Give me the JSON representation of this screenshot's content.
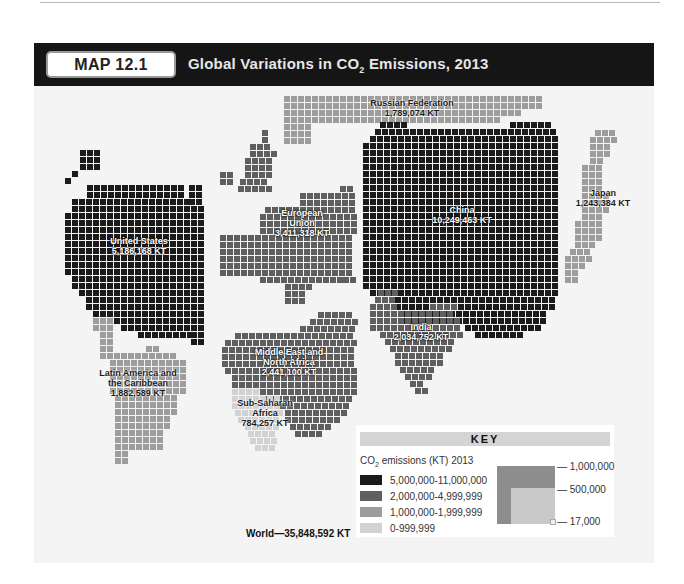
{
  "header": {
    "badge": "MAP 12.1",
    "title_pre": "Global Variations in CO",
    "title_sub": "2",
    "title_post": " Emissions, 2013"
  },
  "colors": {
    "tier1": "#1b1b1b",
    "tier2": "#5f5f5f",
    "tier3": "#9d9d9d",
    "tier4": "#d2d2d2",
    "grid_line": "#f4f4f4"
  },
  "regions": [
    {
      "id": "united-states",
      "name": "United States",
      "value": "5,186,168 KT",
      "tier": 1
    },
    {
      "id": "russian-federation",
      "name": "Russian Federation",
      "value": "1,789,074 KT",
      "tier": 3
    },
    {
      "id": "european-union",
      "name": "European Union",
      "name_line1": "European",
      "name_line2": "Union",
      "value": "3,411,318 KT",
      "tier": 2
    },
    {
      "id": "china",
      "name": "China",
      "value": "10,249,463 KT",
      "tier": 1
    },
    {
      "id": "japan",
      "name": "Japan",
      "value": "1,243,384 KT",
      "tier": 3
    },
    {
      "id": "india",
      "name": "India",
      "value": "2,034,752 KT",
      "tier": 2
    },
    {
      "id": "middle-east-north-africa",
      "name": "Middle East and North Africa",
      "name_line1": "Middle East and",
      "name_line2": "North Africa",
      "value": "2,441,100 KT",
      "tier": 2
    },
    {
      "id": "latin-america-caribbean",
      "name": "Latin America and the Caribbean",
      "name_line1": "Latin America and",
      "name_line2": "the Caribbean",
      "value": "1,882,589 KT",
      "tier": 3
    },
    {
      "id": "sub-saharan-africa",
      "name": "Sub-Saharan Africa",
      "name_line1": "Sub-Saharan",
      "name_line2": "Africa",
      "value": "784,257 KT",
      "tier": 4
    }
  ],
  "world_total": "World—35,848,592 KT",
  "key": {
    "title": "KEY",
    "subtitle_pre": "CO",
    "subtitle_sub": "2",
    "subtitle_post": " emissions (KT) 2013",
    "tiers": [
      {
        "label": "5,000,000-11,000,000",
        "color": "#1b1b1b"
      },
      {
        "label": "2,000,000-4,999,999",
        "color": "#5f5f5f"
      },
      {
        "label": "1,000,000-1,999,999",
        "color": "#9d9d9d"
      },
      {
        "label": "0-999,999",
        "color": "#d2d2d2"
      }
    ],
    "scale_labels": [
      "— 1,000,000",
      "— 500,000",
      "— 17,000"
    ]
  },
  "chart_data": {
    "type": "cartogram",
    "title": "Global Variations in CO2 Emissions, 2013",
    "unit": "KT",
    "categories": [
      "China",
      "United States",
      "European Union",
      "Middle East and North Africa",
      "India",
      "Latin America and the Caribbean",
      "Russian Federation",
      "Japan",
      "Sub-Saharan Africa"
    ],
    "values": [
      10249463,
      5186168,
      3411318,
      2441100,
      2034752,
      1882589,
      1789074,
      1243384,
      784257
    ],
    "world_total": 35848592,
    "legend": [
      "5,000,000-11,000,000",
      "2,000,000-4,999,999",
      "1,000,000-1,999,999",
      "0-999,999"
    ],
    "scale_squares": [
      1000000,
      500000,
      17000
    ]
  }
}
